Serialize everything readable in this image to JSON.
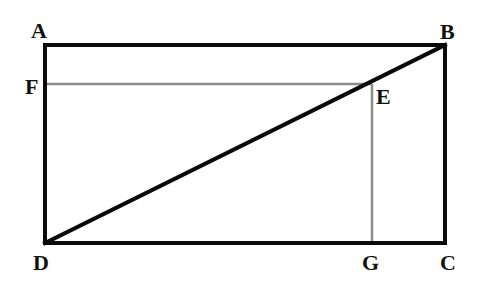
{
  "diagram": {
    "type": "geometry-rectangle-with-diagonal",
    "colors": {
      "background": "#ffffff",
      "main_lines": "#0a0a0a",
      "construction_lines": "#8c8c8c",
      "labels": "#111111"
    },
    "points": {
      "A": {
        "label": "A",
        "x": 45,
        "y": 45
      },
      "B": {
        "label": "B",
        "x": 445,
        "y": 45
      },
      "C": {
        "label": "C",
        "x": 445,
        "y": 243
      },
      "D": {
        "label": "D",
        "x": 45,
        "y": 243
      },
      "E": {
        "label": "E",
        "x": 372,
        "y": 84
      },
      "F": {
        "label": "F",
        "x": 45,
        "y": 84
      },
      "G": {
        "label": "G",
        "x": 372,
        "y": 243
      }
    },
    "segments": [
      {
        "from": "A",
        "to": "B",
        "style": "thick"
      },
      {
        "from": "B",
        "to": "C",
        "style": "thick"
      },
      {
        "from": "C",
        "to": "D",
        "style": "thick"
      },
      {
        "from": "D",
        "to": "A",
        "style": "thick"
      },
      {
        "from": "D",
        "to": "B",
        "style": "thick"
      },
      {
        "from": "F",
        "to": "E",
        "style": "thin"
      },
      {
        "from": "E",
        "to": "G",
        "style": "thin"
      }
    ],
    "labels": {
      "A": "A",
      "B": "B",
      "C": "C",
      "D": "D",
      "E": "E",
      "F": "F",
      "G": "G"
    }
  }
}
